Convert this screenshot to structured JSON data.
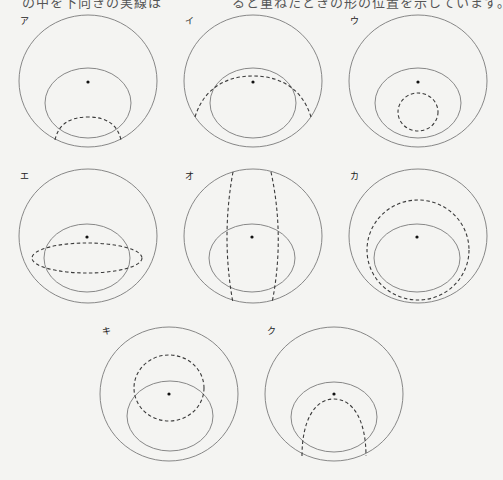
{
  "header": {
    "cropped_text": "の中を下向きの実線は　　　　　ると重ねたときの形の位置を示しています。"
  },
  "colors": {
    "background": "#f4f4f2",
    "solid_line": "#7a7a7a",
    "dashed_line": "#3a3a3a",
    "dot": "#111111"
  },
  "panels": [
    {
      "label": "ア",
      "cx": 88,
      "cy": 81,
      "dashed_shape": "lower arc crossing inner ellipse bottom"
    },
    {
      "label": "イ",
      "cx": 253,
      "cy": 81,
      "dashed_shape": "large arc over inner ellipse top"
    },
    {
      "label": "ウ",
      "cx": 418,
      "cy": 81,
      "dashed_shape": "small circle inside inner ellipse"
    },
    {
      "label": "エ",
      "cx": 88,
      "cy": 236,
      "dashed_shape": "flat horizontal ellipse"
    },
    {
      "label": "オ",
      "cx": 253,
      "cy": 236,
      "dashed_shape": "two vertical curved lines"
    },
    {
      "label": "カ",
      "cx": 418,
      "cy": 236,
      "dashed_shape": "circle surrounding inner ellipse"
    },
    {
      "label": "キ",
      "cx": 169,
      "cy": 394,
      "dashed_shape": "circle centered at dot"
    },
    {
      "label": "ク",
      "cx": 334,
      "cy": 394,
      "dashed_shape": "parabolic arch from bottom"
    }
  ]
}
